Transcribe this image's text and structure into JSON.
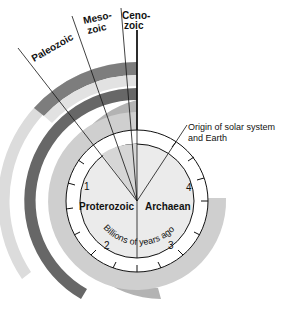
{
  "diagram": {
    "center_label_units": "Billions of years ago",
    "eras": [
      {
        "name_line1": "Ceno-",
        "name_line2": "zoic"
      },
      {
        "name_line1": "Meso-",
        "name_line2": "zoic"
      },
      {
        "name": "Paleozoic"
      }
    ],
    "eons": {
      "left": "Proterozoic",
      "right": "Archaean"
    },
    "dial_numbers": [
      "1",
      "2",
      "3",
      "4"
    ],
    "annotation": {
      "line1": "Origin of solar system",
      "line2": "and Earth"
    },
    "colors": {
      "band_outer_light": "#dcdcdc",
      "band_mid_dark": "#7d7d7d",
      "band_dark": "#676767",
      "band_medium": "#b3b3b3",
      "band_light": "#cfcfcf",
      "dial_ring": "#ffffff",
      "dial_face": "#ebebeb",
      "wedge": "#d6d6d6",
      "line": "#111111"
    }
  }
}
